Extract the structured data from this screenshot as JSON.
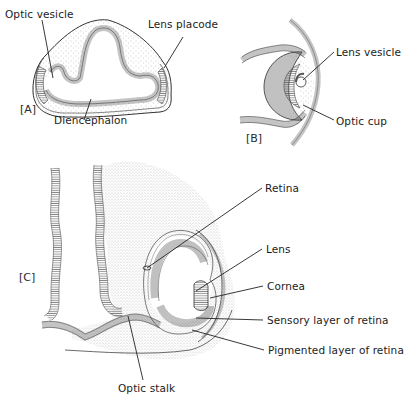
{
  "figure": {
    "panels": {
      "A": {
        "tag": "[A]",
        "labels": {
          "optic_vesicle": "Optic vesicle",
          "lens_placode": "Lens placode",
          "diencephalon": "Diencephalon"
        }
      },
      "B": {
        "tag": "[B]",
        "labels": {
          "lens_vesicle": "Lens vesicle",
          "optic_cup": "Optic cup"
        }
      },
      "C": {
        "tag": "[C]",
        "labels": {
          "retina": "Retina",
          "lens": "Lens",
          "cornea": "Cornea",
          "sensory_layer": "Sensory layer of retina",
          "pigmented_layer": "Pigmented layer of retina",
          "optic_stalk": "Optic stalk"
        }
      }
    },
    "colors": {
      "ink": "#1c1c1c",
      "stipple": "#9a9a9a",
      "hatch": "#555555",
      "background": "#ffffff"
    }
  }
}
